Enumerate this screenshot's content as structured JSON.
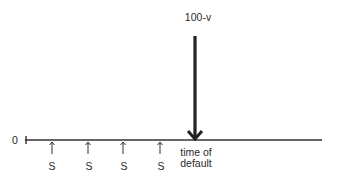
{
  "diagram": {
    "type": "timeline-cashflow",
    "origin_label": "0",
    "payment_label": "S",
    "payments": [
      {
        "x": 52,
        "label": "S"
      },
      {
        "x": 88,
        "label": "S"
      },
      {
        "x": 123,
        "label": "S"
      },
      {
        "x": 160,
        "label": "S"
      }
    ],
    "default_payment": {
      "x": 195,
      "label": "100-v"
    },
    "event_label_line1": "time of",
    "event_label_line2": "default",
    "colors": {
      "line": "#333333",
      "text": "#2a2a2a",
      "background": "#ffffff"
    }
  }
}
